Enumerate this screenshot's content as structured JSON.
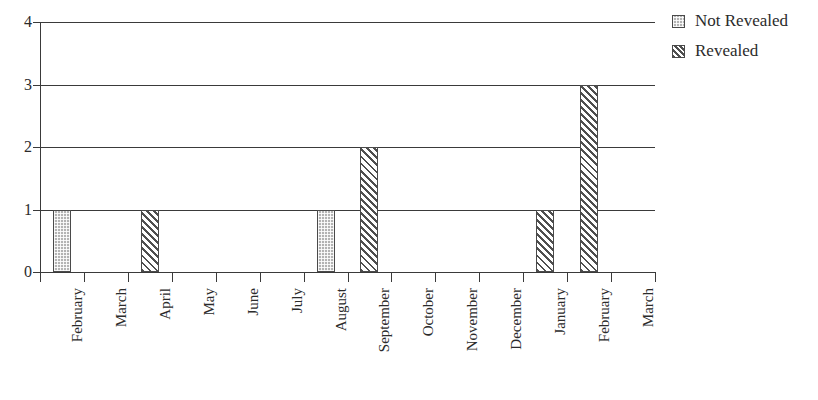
{
  "chart_data": {
    "type": "bar",
    "title": "",
    "xlabel": "",
    "ylabel": "",
    "ylim": [
      0,
      4
    ],
    "yticks": [
      0,
      1,
      2,
      3,
      4
    ],
    "grid": true,
    "legend_position": "right-top",
    "categories": [
      "February",
      "March",
      "April",
      "May",
      "June",
      "July",
      "August",
      "September",
      "October",
      "November",
      "December",
      "January",
      "February",
      "March"
    ],
    "series": [
      {
        "name": "Not Revealed",
        "pattern": "dotted",
        "color": "#b3b3b3",
        "values": [
          1,
          0,
          0,
          0,
          0,
          0,
          1,
          0,
          0,
          0,
          0,
          0,
          0,
          0
        ]
      },
      {
        "name": "Revealed",
        "pattern": "diagonal-hatch",
        "color": "#4f4f4f",
        "values": [
          0,
          0,
          1,
          0,
          0,
          0,
          0,
          2,
          0,
          0,
          0,
          1,
          3,
          0
        ]
      }
    ],
    "bars": [
      {
        "category": "February",
        "category_index": 0,
        "value": 1,
        "series": "Not Revealed"
      },
      {
        "category": "April",
        "category_index": 2,
        "value": 1,
        "series": "Revealed"
      },
      {
        "category": "August",
        "category_index": 6,
        "value": 1,
        "series": "Not Revealed"
      },
      {
        "category": "September",
        "category_index": 7,
        "value": 2,
        "series": "Revealed"
      },
      {
        "category": "January",
        "category_index": 11,
        "value": 1,
        "series": "Revealed"
      },
      {
        "category": "February",
        "category_index": 12,
        "value": 3,
        "series": "Revealed"
      }
    ]
  },
  "legend": {
    "items": [
      {
        "label": "Not Revealed",
        "pattern": "dotted"
      },
      {
        "label": "Revealed",
        "pattern": "diagonal-hatch"
      }
    ]
  },
  "axis": {
    "y_tick_labels": [
      "4",
      "3",
      "2",
      "1",
      "0"
    ]
  }
}
